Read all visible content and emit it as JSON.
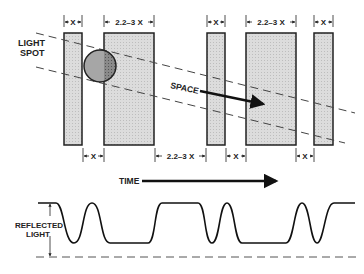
{
  "labels": {
    "light_spot_line1": "LIGHT",
    "light_spot_line2": "SPOT",
    "space": "SPACE",
    "time": "TIME",
    "reflected_line1": "REFLECTED",
    "reflected_line2": "LIGHT"
  },
  "top_dimensions": [
    {
      "label": "X"
    },
    {
      "label": "2.2–3 X"
    },
    {
      "label": "X"
    },
    {
      "label": "2.2–3 X"
    },
    {
      "label": "X"
    }
  ],
  "bottom_dimensions": [
    {
      "label": "X"
    },
    {
      "label": "2.2–3 X"
    },
    {
      "label": "X"
    },
    {
      "label": "X"
    }
  ],
  "bars": [
    {
      "name": "narrow-bar-1",
      "width_class": "X"
    },
    {
      "name": "wide-bar-1",
      "width_class": "2.2–3 X"
    },
    {
      "name": "narrow-bar-2",
      "width_class": "X"
    },
    {
      "name": "wide-bar-2",
      "width_class": "2.2–3 X"
    },
    {
      "name": "narrow-bar-3",
      "width_class": "X"
    }
  ],
  "colors": {
    "bar_fill": "#d9d9d9",
    "outline": "#222222",
    "spot_fill": "#a8a8a8",
    "spot_overlap_fill": "#7a7a7a",
    "dash": "#555555"
  }
}
